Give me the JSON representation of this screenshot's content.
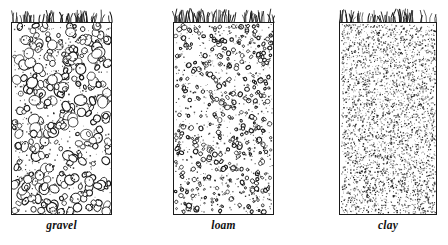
{
  "figure": {
    "width": 448,
    "height": 245,
    "background_color": "#ffffff",
    "ink_color": "#1a1a1a"
  },
  "panels": [
    {
      "id": "gravel",
      "label": "gravel",
      "box": {
        "x": 11,
        "y": 22,
        "width": 101,
        "height": 193
      },
      "label_position": {
        "x": 11,
        "y": 219,
        "width": 101
      },
      "texture": {
        "type": "pebbles",
        "particle_count": 300,
        "particle_min_px": 3,
        "particle_max_px": 11,
        "speckle_count": 420,
        "speckle_size_px": 1.2,
        "outline_color": "#161616",
        "fill_color": "#ffffff",
        "stroke_width": 0.85
      },
      "grass": {
        "blade_count": 62,
        "min_height_px": 6,
        "max_height_px": 13
      }
    },
    {
      "id": "loam",
      "label": "loam",
      "box": {
        "x": 173,
        "y": 22,
        "width": 101,
        "height": 193
      },
      "label_position": {
        "x": 173,
        "y": 219,
        "width": 101
      },
      "texture": {
        "type": "rings",
        "particle_count": 380,
        "particle_min_px": 1.8,
        "particle_max_px": 5,
        "speckle_count": 700,
        "speckle_size_px": 1.1,
        "outline_color": "#161616",
        "fill_color": "#ffffff",
        "stroke_width": 0.8
      },
      "grass": {
        "blade_count": 64,
        "min_height_px": 7,
        "max_height_px": 15
      }
    },
    {
      "id": "clay",
      "label": "clay",
      "box": {
        "x": 339,
        "y": 22,
        "width": 98,
        "height": 193
      },
      "label_position": {
        "x": 339,
        "y": 219,
        "width": 98
      },
      "texture": {
        "type": "stipple",
        "particle_count": 0,
        "particle_min_px": 0,
        "particle_max_px": 0,
        "speckle_count": 3400,
        "speckle_size_px": 1.0,
        "outline_color": "#161616",
        "fill_color": "#ffffff",
        "stroke_width": 0
      },
      "grass": {
        "blade_count": 58,
        "min_height_px": 6,
        "max_height_px": 14
      }
    }
  ]
}
